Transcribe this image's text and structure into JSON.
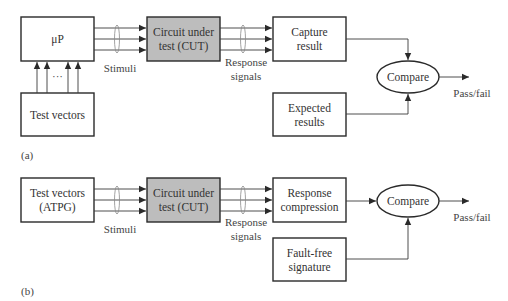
{
  "diagram": {
    "type": "block-diagram",
    "colors": {
      "stroke": "#2a2a2a",
      "cut_fill": "#bdbdbd",
      "background": "#ffffff"
    },
    "part_a": {
      "label": "(a)",
      "processor": {
        "label": "μP"
      },
      "test_vectors": {
        "label": "Test vectors"
      },
      "ellipsis": "···",
      "cut": {
        "line1": "Circuit under",
        "line2": "test (CUT)"
      },
      "stimuli_label": "Stimuli",
      "response_label": {
        "line1": "Response",
        "line2": "signals"
      },
      "capture": {
        "line1": "Capture",
        "line2": "result"
      },
      "expected": {
        "line1": "Expected",
        "line2": "results"
      },
      "compare": {
        "label": "Compare"
      },
      "output_label": "Pass/fail"
    },
    "part_b": {
      "label": "(b)",
      "test_vectors": {
        "line1": "Test vectors",
        "line2": "(ATPG)"
      },
      "cut": {
        "line1": "Circuit under",
        "line2": "test (CUT)"
      },
      "stimuli_label": "Stimuli",
      "response_label": {
        "line1": "Response",
        "line2": "signals"
      },
      "compression": {
        "line1": "Response",
        "line2": "compression"
      },
      "signature": {
        "line1": "Fault-free",
        "line2": "signature"
      },
      "compare": {
        "label": "Compare"
      },
      "output_label": "Pass/fail"
    }
  }
}
